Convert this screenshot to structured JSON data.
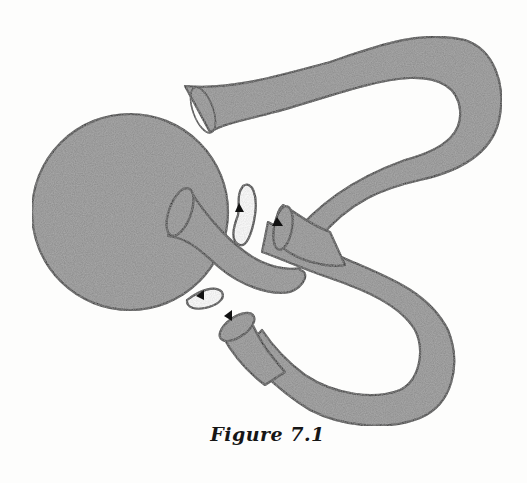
{
  "figure": {
    "caption": "Figure 7.1",
    "colors": {
      "fill": "#8a8a8a",
      "outline": "#141414",
      "background": "#fdfdfc",
      "hole": "#ffffff"
    },
    "parts": [
      {
        "name": "sphere",
        "label": ""
      },
      {
        "name": "upper-handle-tube",
        "label": ""
      },
      {
        "name": "lower-loop-tube",
        "label": ""
      },
      {
        "name": "funnel-left",
        "label": ""
      },
      {
        "name": "funnel-right",
        "label": ""
      },
      {
        "name": "funnel-bottom",
        "label": ""
      }
    ],
    "arrows": [
      {
        "name": "arrow-upper-hole",
        "direction": "up"
      },
      {
        "name": "arrow-right-funnel",
        "direction": "up"
      },
      {
        "name": "arrow-lower-hole",
        "direction": "down-left"
      },
      {
        "name": "arrow-bottom-funnel",
        "direction": "down-left"
      }
    ]
  }
}
